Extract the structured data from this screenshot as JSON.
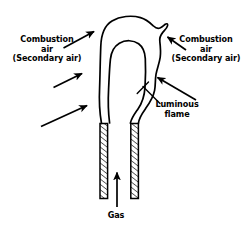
{
  "figure": {
    "background_color": "#ffffff",
    "stroke_color": "#000000",
    "width": 248,
    "height": 235
  },
  "labels": {
    "combustion_left": {
      "line1": "Combustion",
      "line2": "air",
      "line3": "(Secondary air)"
    },
    "combustion_right": {
      "line1": "Combustion",
      "line2": "air",
      "line3": "(Secondary air)"
    },
    "luminous_flame": {
      "line1": "Luminous",
      "line2": "flame"
    },
    "gas": {
      "line1": "Gas"
    }
  },
  "parts": {
    "flame_outline": "luminous-flame-outline",
    "inner_cone": "inner-flame-cone",
    "burner_tube_left": "burner-tube-wall-left",
    "burner_tube_right": "burner-tube-wall-right",
    "gas_arrow": "gas-flow-arrow",
    "air_arrows": [
      "combustion-air-arrow-top-left",
      "combustion-air-arrow-mid-left",
      "combustion-air-arrow-low-left",
      "combustion-air-arrow-top-right",
      "combustion-air-arrow-mid-right"
    ],
    "leader_line": "luminous-flame-leader-line"
  }
}
